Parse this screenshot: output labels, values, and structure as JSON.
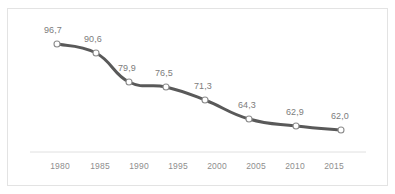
{
  "chart_data": {
    "type": "line",
    "title": "",
    "subtitle": "",
    "xlabel": "",
    "ylabel": "",
    "categories": [
      "1980",
      "1985",
      "1990",
      "1995",
      "2000",
      "2005",
      "2010",
      "2015"
    ],
    "x": [
      1980,
      1985,
      1990,
      1995,
      2000,
      2005,
      2010,
      2015
    ],
    "values": [
      96.7,
      90.6,
      79.9,
      76.5,
      71.3,
      64.3,
      62.9,
      62.0
    ],
    "data_labels": [
      "96,7",
      "90,6",
      "79,9",
      "76,5",
      "71,3",
      "64,3",
      "62,9",
      "62,0"
    ],
    "series": [
      {
        "name": "",
        "values": [
          96.7,
          90.6,
          79.9,
          76.5,
          71.3,
          64.3,
          62.9,
          62.0
        ],
        "labels": [
          "96,7",
          "90,6",
          "79,9",
          "76,5",
          "71,3",
          "64,3",
          "62,9",
          "62,0"
        ],
        "line_color": "#595959",
        "marker_fill": "#ffffff",
        "marker_stroke": "#8c8c8c",
        "smoothing": "spline"
      }
    ],
    "axis": {
      "x_tick_labels": [
        "1980",
        "1985",
        "1990",
        "1995",
        "2000",
        "2005",
        "2010",
        "2015"
      ],
      "y_axis_visible": false,
      "x_axis_line_color": "#e0e0e0",
      "grid": false,
      "ylim": [
        55,
        102
      ],
      "xlim": [
        1978,
        2017
      ]
    },
    "legend": {
      "visible": false,
      "position": "none",
      "entries": []
    },
    "style": {
      "background": "#ffffff",
      "border_color": "#e3e3e3",
      "label_color": "#7c7c7c",
      "tick_color": "#8e8e8e"
    }
  },
  "points": [
    {
      "label": "96,7",
      "tick": "1980",
      "cx": 57,
      "cy": 44,
      "lx": 44,
      "ly": 25
    },
    {
      "label": "90,6",
      "tick": "1985",
      "cx": 96,
      "cy": 53,
      "lx": 84,
      "ly": 34
    },
    {
      "label": "79,9",
      "tick": "1990",
      "cx": 129,
      "cy": 82,
      "lx": 118,
      "ly": 63
    },
    {
      "label": "76,5",
      "tick": "1995",
      "cx": 166,
      "cy": 87,
      "lx": 155,
      "ly": 68
    },
    {
      "label": "71,3",
      "tick": "2000",
      "cx": 205,
      "cy": 100,
      "lx": 194,
      "ly": 81
    },
    {
      "label": "64,3",
      "tick": "2005",
      "cx": 249,
      "cy": 119,
      "lx": 238,
      "ly": 100
    },
    {
      "label": "62,9",
      "tick": "2010",
      "cx": 296,
      "cy": 126,
      "lx": 286,
      "ly": 107
    },
    {
      "label": "62,0",
      "tick": "2015",
      "cx": 341,
      "cy": 130,
      "lx": 331,
      "ly": 111
    }
  ],
  "ticks": [
    {
      "label": "1980",
      "x": 60
    },
    {
      "label": "1985",
      "x": 100
    },
    {
      "label": "1990",
      "x": 139
    },
    {
      "label": "1995",
      "x": 178
    },
    {
      "label": "2000",
      "x": 217
    },
    {
      "label": "2005",
      "x": 256
    },
    {
      "label": "2010",
      "x": 295
    },
    {
      "label": "2015",
      "x": 334
    }
  ]
}
